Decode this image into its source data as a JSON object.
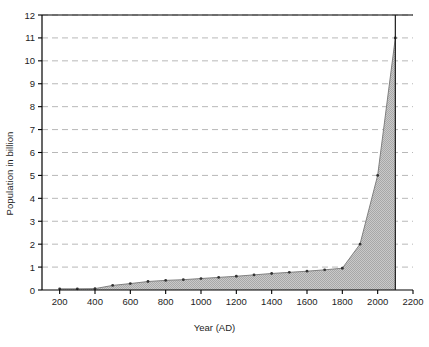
{
  "chart_data": {
    "type": "area",
    "title": "",
    "subtitle": "",
    "xlabel": "Year (AD)",
    "ylabel": "Population in billion",
    "xlim": [
      100,
      2200
    ],
    "ylim": [
      0,
      12
    ],
    "xticks": [
      200,
      400,
      600,
      800,
      1000,
      1200,
      1400,
      1600,
      1800,
      2000,
      2200
    ],
    "yticks": [
      0,
      1,
      2,
      3,
      4,
      5,
      6,
      7,
      8,
      9,
      10,
      11,
      12
    ],
    "xtick_labels": [
      "200",
      "400",
      "600",
      "800",
      "1000",
      "1200",
      "1400",
      "1600",
      "1800",
      "2000",
      "2200"
    ],
    "ytick_labels": [
      "0",
      "1",
      "2",
      "3",
      "4",
      "5",
      "6",
      "7",
      "8",
      "9",
      "10",
      "11",
      "12"
    ],
    "grid": true,
    "grid_axis": "y",
    "grid_style": "dashed",
    "legend": false,
    "legend_position": "none",
    "marker": "point",
    "fill_color": "#b4b4b4",
    "line_color": "#808080",
    "marker_color": "#333333",
    "axis_color": "#000000",
    "grid_color": "#b0b0b0",
    "annotation_line_x": 2100,
    "x": [
      200,
      300,
      400,
      500,
      600,
      700,
      800,
      900,
      1000,
      1100,
      1200,
      1300,
      1400,
      1500,
      1600,
      1700,
      1800,
      1900,
      2000,
      2100
    ],
    "series": [
      {
        "name": "World population",
        "values": [
          0.05,
          0.05,
          0.06,
          0.2,
          0.28,
          0.37,
          0.42,
          0.45,
          0.5,
          0.55,
          0.6,
          0.66,
          0.72,
          0.77,
          0.82,
          0.88,
          0.95,
          2.0,
          5.0,
          11.0
        ]
      }
    ]
  }
}
